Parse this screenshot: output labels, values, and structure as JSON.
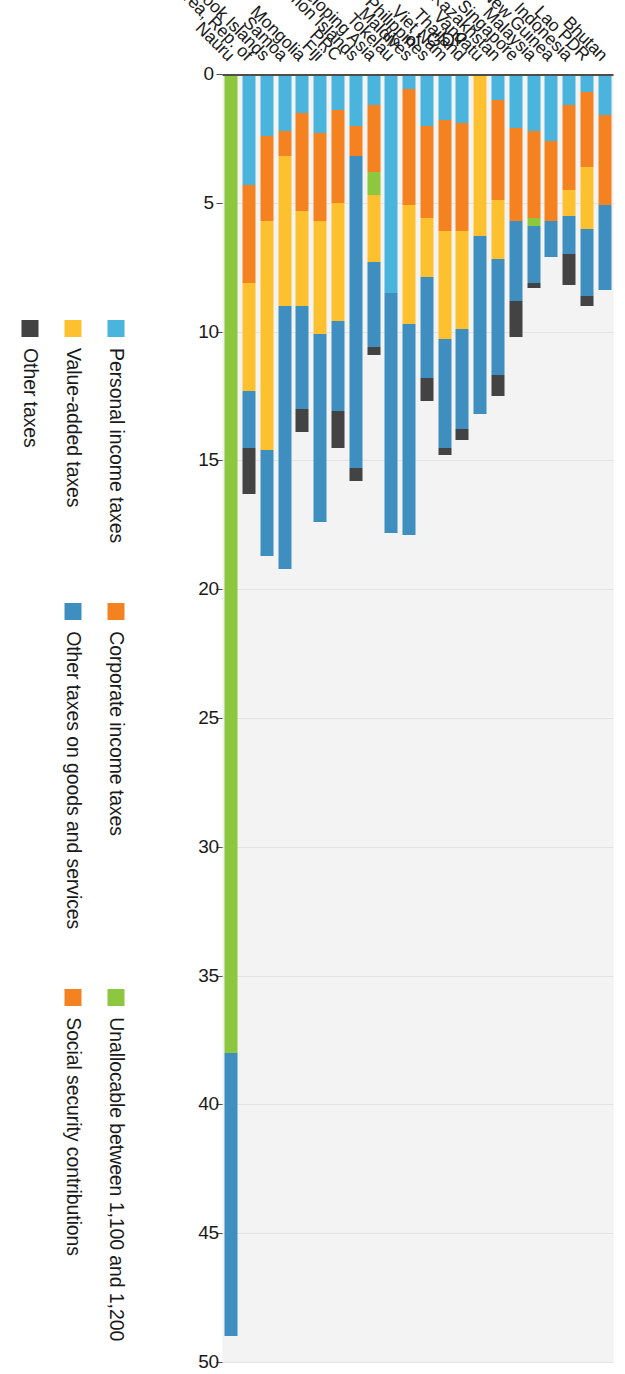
{
  "chart_data": {
    "type": "bar",
    "orientation": "vertical-stacked",
    "title": "",
    "xlabel": "",
    "ylabel": "% of GDP",
    "ylim": [
      0,
      50
    ],
    "yticks": [
      0,
      5,
      10,
      15,
      20,
      25,
      30,
      35,
      40,
      45,
      50
    ],
    "grid": true,
    "legend_position": "bottom",
    "categories": [
      "Nauru",
      "Korea, Rep. of",
      "Cook Islands",
      "Samoa",
      "Mongolia",
      "Fiji",
      "PRC",
      "Solomon Islands",
      "Developing Asia",
      "Tokelau",
      "Maldives",
      "Philippines",
      "Viet Nam",
      "Thailand",
      "Vanuatu",
      "Kazakhstan",
      "Singapore",
      "Malaysia",
      "Papua New Guinea",
      "Indonesia",
      "Lao PDR",
      "Bhutan"
    ],
    "series": [
      {
        "name": "Personal income taxes",
        "color": "#4bb4dd",
        "values": [
          0.0,
          4.3,
          2.4,
          2.2,
          1.5,
          2.3,
          1.4,
          2.0,
          1.2,
          8.5,
          0.6,
          2.0,
          1.8,
          1.9,
          0.0,
          1.0,
          2.1,
          2.2,
          2.6,
          1.2,
          0.7,
          1.6
        ]
      },
      {
        "name": "Corporate income taxes",
        "color": "#f58220",
        "values": [
          0.0,
          3.8,
          3.3,
          1.0,
          3.8,
          3.4,
          3.6,
          1.2,
          2.6,
          0.0,
          4.5,
          3.6,
          4.3,
          4.2,
          0.0,
          3.9,
          3.6,
          3.4,
          3.1,
          3.3,
          2.9,
          3.5
        ]
      },
      {
        "name": "Unallocable between 1,100 and 1,200",
        "color": "#8dc63f",
        "values": [
          38.0,
          0.0,
          0.0,
          0.0,
          0.0,
          0.0,
          0.0,
          0.0,
          0.9,
          0.0,
          0.0,
          0.0,
          0.0,
          0.0,
          0.0,
          0.0,
          0.0,
          0.3,
          0.0,
          0.0,
          0.0,
          0.0
        ]
      },
      {
        "name": "Value-added taxes",
        "color": "#fdc130",
        "values": [
          0.0,
          4.2,
          8.9,
          5.8,
          3.7,
          4.4,
          4.6,
          0.0,
          2.6,
          0.0,
          4.6,
          2.3,
          4.2,
          3.8,
          6.3,
          2.3,
          0.0,
          0.0,
          0.0,
          1.0,
          2.4,
          0.0
        ]
      },
      {
        "name": "Other taxes on goods and services",
        "color": "#3e8fbf",
        "values": [
          11.0,
          2.2,
          4.1,
          10.2,
          4.0,
          7.3,
          3.5,
          12.1,
          3.3,
          9.3,
          8.2,
          3.9,
          4.2,
          3.9,
          6.9,
          4.5,
          3.1,
          2.2,
          1.4,
          1.5,
          2.6,
          3.3
        ]
      },
      {
        "name": "Other taxes",
        "color": "#434343",
        "values": [
          0.0,
          1.8,
          0.0,
          0.0,
          0.9,
          0.0,
          1.4,
          0.5,
          0.3,
          0.0,
          0.0,
          0.9,
          0.3,
          0.4,
          0.0,
          0.8,
          1.4,
          0.2,
          0.0,
          1.2,
          0.4,
          0.0
        ]
      }
    ],
    "legend_columns": [
      [
        {
          "label": "Personal income taxes",
          "color": "#4bb4dd"
        },
        {
          "label": "Value-added taxes",
          "color": "#fdc130"
        },
        {
          "label": "Other taxes",
          "color": "#434343"
        }
      ],
      [
        {
          "label": "Corporate income taxes",
          "color": "#f58220"
        },
        {
          "label": "Other taxes on goods and services",
          "color": "#3e8fbf"
        }
      ],
      [
        {
          "label": "Unallocable between 1,100 and 1,200",
          "color": "#8dc63f"
        },
        {
          "label": "Social security contributions",
          "color": "#f58220"
        }
      ]
    ]
  }
}
